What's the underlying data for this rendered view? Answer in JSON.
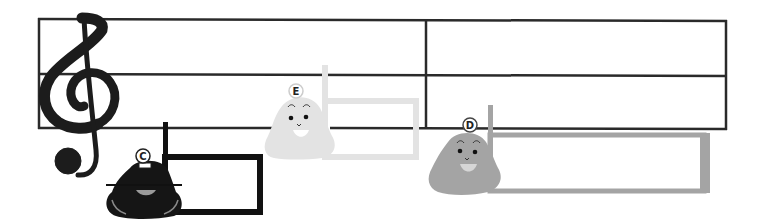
{
  "staff": {
    "lines": 3,
    "barline": "single",
    "clef": "treble-clef-icon",
    "line_color": "#2a2a2a"
  },
  "bells": [
    {
      "note": "C",
      "color": "#151515",
      "highlight": "#9a9a9a",
      "position": "below staff"
    },
    {
      "note": "E",
      "color": "#e3e3e3",
      "highlight": "#ffffff",
      "position": "on bottom line"
    },
    {
      "note": "D",
      "color": "#a4a4a4",
      "highlight": "#d6d6d6",
      "position": "below bottom line"
    }
  ]
}
